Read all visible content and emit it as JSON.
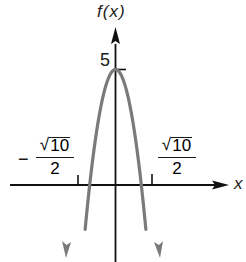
{
  "chart_data": {
    "type": "line",
    "title": "",
    "function": "f(x) = 5 - 2x^2",
    "xlabel": "x",
    "ylabel": "f(x)",
    "grid": false,
    "legend": null,
    "series": [
      {
        "name": "f(x)",
        "color": "#7a7a7a",
        "x": [
          -1.9,
          -1.5811,
          -1.0,
          -0.5,
          0,
          0.5,
          1.0,
          1.5811,
          1.9
        ],
        "y": [
          -2.22,
          0,
          3.0,
          4.5,
          5,
          4.5,
          3.0,
          0,
          -2.22
        ]
      }
    ],
    "annotations": {
      "y_intercept_label": "5",
      "vertex": {
        "x": 0,
        "y": 5
      },
      "roots": [
        {
          "x": -1.5811,
          "label_sign": "−",
          "label_num": "10",
          "label_den": "2",
          "label_text": "−√10/2"
        },
        {
          "x": 1.5811,
          "label_sign": "",
          "label_num": "10",
          "label_den": "2",
          "label_text": "√10/2"
        }
      ]
    }
  },
  "labels": {
    "y_axis": "f(x)",
    "x_axis": "x",
    "tick_5": "5",
    "left_root": {
      "sign": "−",
      "radical": "√",
      "radicand": "10",
      "denominator": "2"
    },
    "right_root": {
      "radical": "√",
      "radicand": "10",
      "denominator": "2"
    }
  },
  "colors": {
    "axis": "#111111",
    "curve": "#7a7a7a",
    "text": "#1a1a1a"
  }
}
